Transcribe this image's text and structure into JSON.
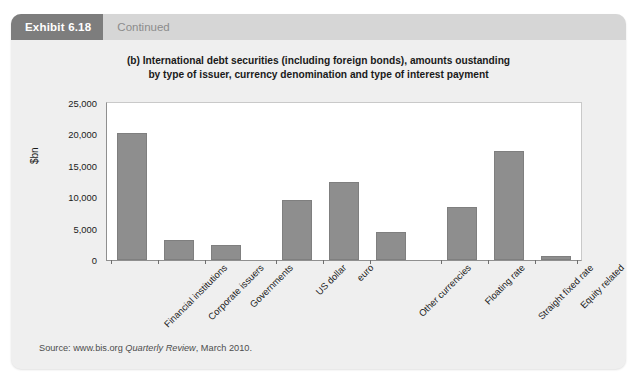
{
  "exhibit": {
    "tag_label": "Exhibit 6.18",
    "continued_label": "Continued"
  },
  "title": {
    "line1": "(b) International debt securities (including foreign bonds), amounts oustanding",
    "line2": "by type of issuer, currency denomination and type of interest payment"
  },
  "source": {
    "prefix": "Source: www.bis.org ",
    "italic": "Quarterly Review",
    "suffix": ", March 2010."
  },
  "colors": {
    "panel_bg": "#efefef",
    "header_bar": "#d6d6d6",
    "tag_bg": "#7d7d7d",
    "bar_fill": "#8e8e8e",
    "plot_bg": "#ffffff",
    "axis_line": "#8f8f8f"
  },
  "chart_data": {
    "type": "bar",
    "title": "(b) International debt securities (including foreign bonds), amounts oustanding by type of issuer, currency denomination and type of interest payment",
    "xlabel": "",
    "ylabel": "$bn",
    "ylim": [
      0,
      25000
    ],
    "ytick_labels": [
      "0",
      "5,000",
      "10,000",
      "15,000",
      "20,000",
      "25,000"
    ],
    "ytick_values": [
      0,
      5000,
      10000,
      15000,
      20000,
      25000
    ],
    "grid": false,
    "legend": "none",
    "categories": [
      "Financial institutions",
      "Corporate issuers",
      "Governments",
      "US dollar",
      "euro",
      "Other currencies",
      "Floating rate",
      "Straight fixed rate",
      "Equity related"
    ],
    "values": [
      20300,
      3200,
      2400,
      9600,
      12500,
      4500,
      8500,
      17300,
      600
    ],
    "groups": [
      {
        "name": "Type of issuer",
        "categories": [
          "Financial institutions",
          "Corporate issuers",
          "Governments"
        ]
      },
      {
        "name": "Currency denomination",
        "categories": [
          "US dollar",
          "euro",
          "Other currencies"
        ]
      },
      {
        "name": "Type of interest payment",
        "categories": [
          "Floating rate",
          "Straight fixed rate",
          "Equity related"
        ]
      }
    ]
  }
}
